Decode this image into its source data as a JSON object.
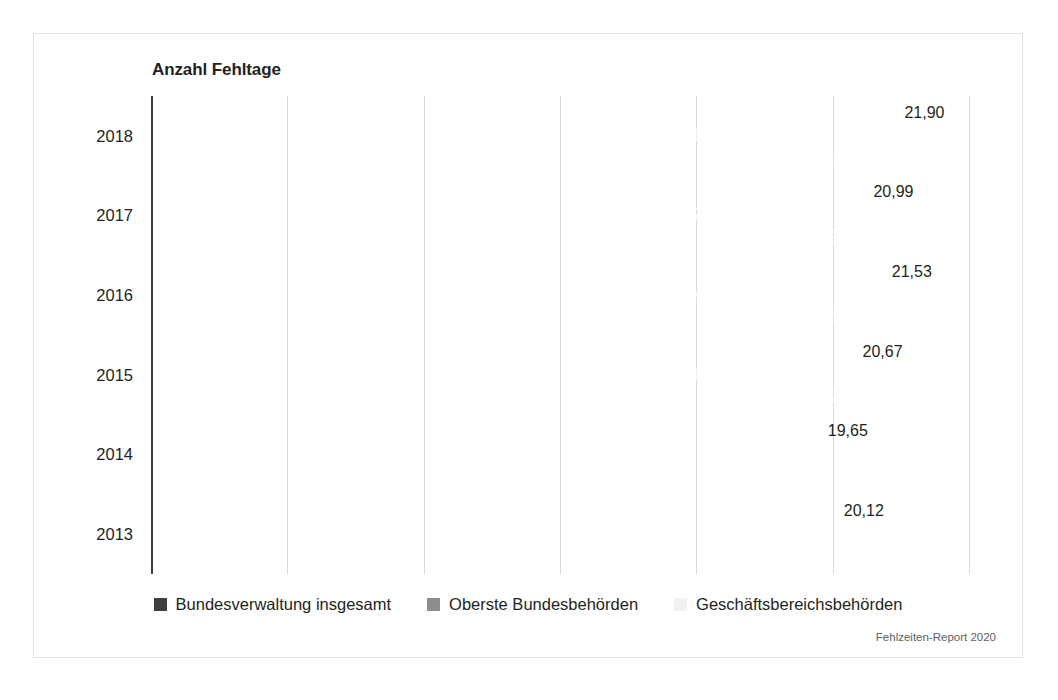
{
  "figure": {
    "title": "Anzahl Fehltage",
    "source_note": "Fehlzeiten-Report 2020"
  },
  "legend": {
    "items": [
      {
        "label": "Bundesverwaltung insgesamt",
        "color": "#3f3f3f",
        "swatch_name": "legend-swatch-bundesverwaltung"
      },
      {
        "label": "Oberste Bundesbehörden",
        "color": "#8d8d8d",
        "swatch_name": "legend-swatch-oberste"
      },
      {
        "label": "Geschäftsbereichsbehörden",
        "color": "#f2f2f2",
        "swatch_name": "legend-swatch-geschaefts"
      }
    ]
  },
  "chart_data": {
    "type": "bar",
    "orientation": "horizontal",
    "title": "Anzahl Fehltage",
    "xlabel": "",
    "ylabel": "",
    "xlim": [
      0,
      24
    ],
    "grid": true,
    "gridlines": [
      0,
      4,
      8,
      12,
      16,
      20,
      24
    ],
    "legend_position": "bottom",
    "categories": [
      "2018",
      "2017",
      "2016",
      "2015",
      "2014",
      "2013"
    ],
    "series": [
      {
        "name": "Bundesverwaltung insgesamt",
        "color": "#3f3f3f",
        "values": [
          21.35,
          20.55,
          21.01,
          20.25,
          19.25,
          19.75
        ],
        "labels": [
          "21,35",
          "20,55",
          "21,01",
          "20,25",
          "19,25",
          "19,75"
        ],
        "label_position": "inside"
      },
      {
        "name": "Oberste Bundesbehörden",
        "color": "#8d8d8d",
        "values": [
          16.36,
          16.5,
          16.2,
          16.24,
          15.23,
          15.94
        ],
        "labels": [
          "16,36",
          "16,50",
          "16,20",
          "16,24",
          "15,23",
          "15,94"
        ],
        "label_position": "inside"
      },
      {
        "name": "Geschäftsbereichsbehörden",
        "color": "#f2f2f2",
        "values": [
          21.9,
          20.99,
          21.53,
          20.67,
          19.65,
          20.12
        ],
        "labels": [
          "21,90",
          "20,99",
          "21,53",
          "20,67",
          "19,65",
          "20,12"
        ],
        "label_position": "outside"
      }
    ]
  }
}
